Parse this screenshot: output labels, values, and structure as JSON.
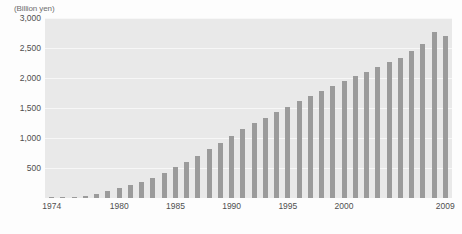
{
  "chart_data": {
    "type": "bar",
    "title": "",
    "subtitle": "",
    "unit_caption": "(Billion yen)",
    "xlabel": "",
    "ylabel": "",
    "ylim": [
      0,
      3000
    ],
    "xlim": [
      1973.4,
      2009.6
    ],
    "grid": true,
    "legend": null,
    "ytick_labels": [
      "500",
      "1,000",
      "1,500",
      "2,000",
      "2,500",
      "3,000"
    ],
    "ytick_values": [
      500,
      1000,
      1500,
      2000,
      2500,
      3000
    ],
    "xtick_labels": [
      "1974",
      "1980",
      "1985",
      "1990",
      "1995",
      "2000",
      "2009"
    ],
    "xtick_values": [
      1974,
      1980,
      1985,
      1990,
      1995,
      2000,
      2009
    ],
    "categories": [
      1974,
      1975,
      1976,
      1977,
      1978,
      1979,
      1980,
      1981,
      1982,
      1983,
      1984,
      1985,
      1986,
      1987,
      1988,
      1989,
      1990,
      1991,
      1992,
      1993,
      1994,
      1995,
      1996,
      1997,
      1998,
      1999,
      2000,
      2001,
      2002,
      2003,
      2004,
      2005,
      2006,
      2007,
      2008,
      2009
    ],
    "values": [
      10,
      15,
      25,
      40,
      70,
      110,
      160,
      210,
      270,
      340,
      420,
      510,
      600,
      700,
      810,
      920,
      1040,
      1150,
      1250,
      1340,
      1430,
      1520,
      1610,
      1700,
      1780,
      1860,
      1950,
      2030,
      2100,
      2180,
      2260,
      2340,
      2450,
      2570,
      2760,
      2700
    ],
    "bar_color": "#9b9b9b",
    "plot_background": "#e9e9e9",
    "gridline_color": "#f7f7f7"
  }
}
